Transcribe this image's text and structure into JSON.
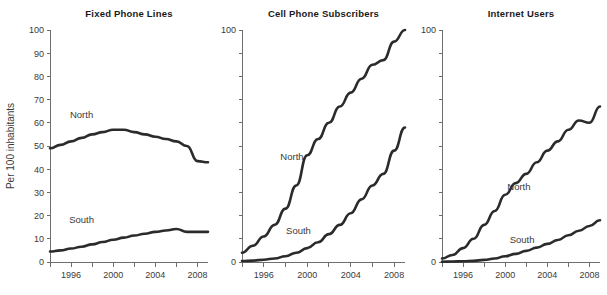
{
  "figure": {
    "background": "#ffffff",
    "line_color": "#2b2b2b",
    "axis_color": "#6e6e6e",
    "text_color": "#3a3a3a",
    "shared_ylabel": "Per 100 inhabitants"
  },
  "chart_data": [
    {
      "type": "line",
      "title": "Fixed Phone Lines",
      "xlabel": "",
      "ylabel": "Per 100 inhabitants",
      "xlim": [
        1994,
        2009
      ],
      "ylim": [
        0,
        100
      ],
      "ytick_values": [
        0,
        10,
        20,
        30,
        40,
        50,
        60,
        70,
        80,
        90,
        100
      ],
      "ytick_labels": [
        "0",
        "10",
        "20",
        "30",
        "40",
        "50",
        "60",
        "70",
        "80",
        "90",
        "100"
      ],
      "xtick_values": [
        1994,
        1996,
        1998,
        2000,
        2002,
        2004,
        2006,
        2008
      ],
      "xtick_labels": [
        "",
        "1996",
        "",
        "2000",
        "",
        "2004",
        "",
        "2008"
      ],
      "grid": false,
      "legend_position": "inline-annotation",
      "x": [
        1994,
        1995,
        1996,
        1997,
        1998,
        1999,
        2000,
        2001,
        2002,
        2003,
        2004,
        2005,
        2006,
        2007,
        2008,
        2009
      ],
      "series": [
        {
          "name": "North",
          "label_x": 1997,
          "label_y": 62,
          "values": [
            49,
            50.5,
            52,
            53.5,
            55,
            56,
            57,
            57,
            56,
            55,
            54,
            53,
            52,
            50,
            43.5,
            43
          ]
        },
        {
          "name": "South",
          "label_x": 1997,
          "label_y": 17,
          "values": [
            4.5,
            5,
            5.8,
            6.6,
            7.6,
            8.6,
            9.6,
            10.5,
            11.4,
            12.2,
            13,
            13.6,
            14.2,
            13,
            13,
            13
          ]
        }
      ]
    },
    {
      "type": "line",
      "title": "Cell Phone Subscribers",
      "xlabel": "",
      "ylabel": "",
      "xlim": [
        1994,
        2009
      ],
      "ylim": [
        0,
        100
      ],
      "ytick_values": [
        0,
        10,
        20,
        30,
        40,
        50,
        60,
        70,
        80,
        90,
        100
      ],
      "ytick_labels": [
        "0",
        "",
        "",
        "",
        "",
        "",
        "",
        "",
        "",
        "",
        "100"
      ],
      "xtick_values": [
        1994,
        1996,
        1998,
        2000,
        2002,
        2004,
        2006,
        2008
      ],
      "xtick_labels": [
        "",
        "1996",
        "",
        "2000",
        "",
        "2004",
        "",
        "2008"
      ],
      "grid": false,
      "legend_position": "inline-annotation",
      "x": [
        1994,
        1995,
        1996,
        1997,
        1998,
        1999,
        2000,
        2001,
        2002,
        2003,
        2004,
        2005,
        2006,
        2007,
        2008,
        2009
      ],
      "series": [
        {
          "name": "North",
          "label_x": 1998.6,
          "label_y": 44,
          "values": [
            4,
            7,
            11,
            16,
            23,
            33,
            46,
            53,
            60,
            67,
            73,
            79,
            85,
            87,
            95,
            100
          ]
        },
        {
          "name": "South",
          "label_x": 1999.2,
          "label_y": 12,
          "values": [
            0.4,
            0.6,
            1,
            1.5,
            2.5,
            4,
            6,
            8.5,
            12,
            16,
            21,
            27,
            33,
            38,
            48,
            58
          ]
        }
      ]
    },
    {
      "type": "line",
      "title": "Internet Users",
      "xlabel": "",
      "ylabel": "",
      "xlim": [
        1994,
        2009
      ],
      "ylim": [
        0,
        100
      ],
      "ytick_values": [
        0,
        10,
        20,
        30,
        40,
        50,
        60,
        70,
        80,
        90,
        100
      ],
      "ytick_labels": [
        "0",
        "",
        "",
        "",
        "",
        "",
        "",
        "",
        "",
        "",
        "100"
      ],
      "xtick_values": [
        1994,
        1996,
        1998,
        2000,
        2002,
        2004,
        2006,
        2008
      ],
      "xtick_labels": [
        "",
        "1996",
        "",
        "2000",
        "",
        "2004",
        "",
        "2008"
      ],
      "grid": false,
      "legend_position": "inline-annotation",
      "x": [
        1994,
        1995,
        1996,
        1997,
        1998,
        1999,
        2000,
        2001,
        2002,
        2003,
        2004,
        2005,
        2006,
        2007,
        2008,
        2009
      ],
      "series": [
        {
          "name": "North",
          "label_x": 2001.3,
          "label_y": 31,
          "values": [
            1.5,
            3,
            6,
            10,
            16,
            22,
            29,
            34,
            38,
            43,
            48,
            52,
            57,
            61,
            60,
            67
          ]
        },
        {
          "name": "South",
          "label_x": 2001.6,
          "label_y": 8,
          "values": [
            0.1,
            0.2,
            0.3,
            0.5,
            0.9,
            1.5,
            2.5,
            3.5,
            4.8,
            6.2,
            7.8,
            9.5,
            11.5,
            13.5,
            15.5,
            18
          ]
        }
      ]
    }
  ]
}
